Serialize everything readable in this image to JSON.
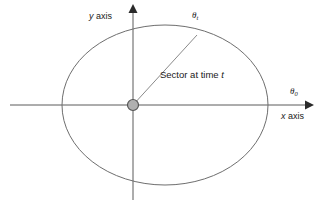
{
  "figure": {
    "type": "diagram",
    "width": 323,
    "height": 208,
    "background_color": "#ffffff"
  },
  "colors": {
    "stroke": "#6e6e6e",
    "axis": "#5a5a5a",
    "text": "#1a1a1a",
    "origin_fill": "#b0b0b0",
    "origin_stroke": "#555555"
  },
  "axes": {
    "x": {
      "label": "x axis",
      "label_italic_part": "x",
      "arrow": "right",
      "y_pixel": 105,
      "start_x": 10,
      "end_x": 314
    },
    "y": {
      "label": "y axis",
      "label_italic_part": "y",
      "arrow": "up",
      "x_pixel": 133,
      "start_y": 200,
      "end_y": 4
    }
  },
  "ellipse": {
    "center_x": 165,
    "center_y": 105,
    "radius_x": 103,
    "radius_y": 80,
    "stroke_color": "#6e6e6e",
    "stroke_width": 1
  },
  "origin": {
    "name": "focus-point",
    "x": 133,
    "y": 105,
    "radius": 5.5
  },
  "radius_line": {
    "from_x": 133,
    "from_y": 105,
    "to_x": 197,
    "to_y": 35
  },
  "labels": {
    "theta_t": {
      "symbol": "θ",
      "subscript": "t"
    },
    "theta_0": {
      "symbol": "θ",
      "subscript": "0"
    },
    "sector_prefix": "Sector at time ",
    "sector_variable": "t",
    "y_axis": " axis",
    "x_axis": " axis"
  }
}
